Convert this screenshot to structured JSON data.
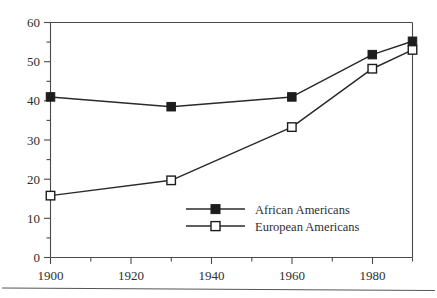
{
  "chart_data": {
    "type": "line",
    "title": "",
    "subtitle": "",
    "xlabel": "",
    "ylabel": "",
    "x": [
      1900,
      1930,
      1960,
      1980,
      1990
    ],
    "xlim": [
      1900,
      1990
    ],
    "ylim": [
      0,
      60
    ],
    "grid": false,
    "legend_position": "center-right-inside",
    "x_tick_labels": [
      "1900",
      "1920",
      "1940",
      "1960",
      "1980"
    ],
    "x_tick_values": [
      1900,
      1920,
      1940,
      1960,
      1980
    ],
    "x_minor_tick_values": [
      1910,
      1930,
      1950,
      1970,
      1990
    ],
    "y_tick_labels": [
      "0",
      "10",
      "20",
      "30",
      "40",
      "50",
      "60"
    ],
    "y_tick_values": [
      0,
      10,
      20,
      30,
      40,
      50,
      60
    ],
    "y_minor_tick_values": [
      5,
      15,
      25,
      35,
      45,
      55
    ],
    "series": [
      {
        "name": "African Americans",
        "marker": "filled-square",
        "values": [
          41,
          38.5,
          41,
          51.8,
          55.2
        ]
      },
      {
        "name": "European Americans",
        "marker": "open-square",
        "values": [
          15.8,
          19.7,
          33.3,
          48.2,
          53
        ]
      }
    ]
  },
  "legend": {
    "items": [
      {
        "label": "African Americans",
        "marker": "filled-square"
      },
      {
        "label": "European Americans",
        "marker": "open-square"
      }
    ]
  },
  "axes": {
    "y_labels": [
      "60",
      "50",
      "40",
      "30",
      "20",
      "10",
      "0"
    ],
    "x_labels": [
      "1900",
      "1920",
      "1940",
      "1960",
      "1980"
    ]
  }
}
